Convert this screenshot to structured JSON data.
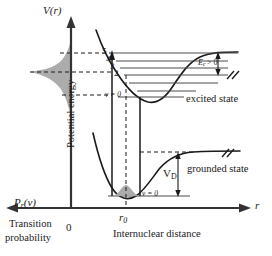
{
  "figure": {
    "type": "potential-energy-curve-diagram",
    "axes": {
      "y_axis_label": "V(r)",
      "y_axis_name": "Potential energy",
      "x_axis_label": "r",
      "x_axis_name": "Internuclear distance",
      "origin_label": "0",
      "left_axis_label": "P",
      "left_axis_label_sub": "r",
      "left_axis_label_arg": "(v)",
      "left_axis_name_line1": "Transition",
      "left_axis_name_line2": "probability",
      "equilibrium_label": "r",
      "equilibrium_sub": "0"
    },
    "states": {
      "excited_label": "excited state",
      "ground_label": "grounded state",
      "excited_v0_label": "v = 0",
      "ground_v0_label": "v = 0"
    },
    "annotations": {
      "dissociation_label": "V",
      "dissociation_sub": "D",
      "excess_energy_label": "E",
      "excess_energy_sub": "c",
      "excess_energy_rel": "> 0"
    },
    "vibrational_levels": [
      "5",
      "4",
      "3",
      "2"
    ],
    "colors": {
      "line": "#1a1a1a",
      "fill_grey": "#a8a8a8",
      "level_line": "#4d4d4d",
      "background": "#ffffff"
    }
  }
}
